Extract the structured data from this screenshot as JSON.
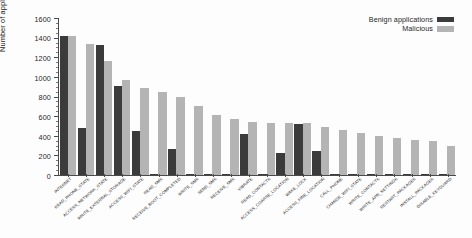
{
  "chart_data": {
    "type": "bar",
    "title": "",
    "subtitle": "",
    "xlabel": "",
    "ylabel": "Number of applications",
    "ylim": [
      0,
      1600
    ],
    "yticks": [
      0,
      200,
      400,
      600,
      800,
      1000,
      1200,
      1400,
      1600
    ],
    "ytick_labels": [
      "0",
      "200",
      "400",
      "600",
      "800",
      "1000",
      "1200",
      "1400",
      "1600"
    ],
    "grid": false,
    "legend_position": "top-right",
    "categories": [
      "INTERNET",
      "READ_PHONE_STATE",
      "ACCESS_NETWORK_STATE",
      "WRITE_EXTERNAL_STORAGE",
      "ACCESS_WIFI_STATE",
      "READ_SMS",
      "RECEIVE_BOOT_COMPLETED",
      "WRITE_SMS",
      "SEND_SMS",
      "RECEIVE_SMS",
      "VIBRATE",
      "READ_CONTACTS",
      "ACCESS_COARSE_LOCATION",
      "WAKE_LOCK",
      "ACCESS_FINE_LOCATION",
      "CALL_PHONE",
      "CHANGE_WIFI_STATE",
      "WRITE_CONTACTS",
      "WRITE_APN_SETTINGS",
      "RESTART_PACKAGES",
      "INSTALL_PACKAGES",
      "DISABLE_KEYGUARD"
    ],
    "series": [
      {
        "name": "Benign applications",
        "color": "#3b3b3b",
        "values": [
          1415,
          480,
          1320,
          910,
          450,
          0,
          265,
          0,
          0,
          0,
          420,
          0,
          225,
          520,
          240,
          0,
          0,
          0,
          0,
          0,
          0,
          0
        ]
      },
      {
        "name": "Malicious",
        "color": "#b4b4b4",
        "values": [
          1415,
          1340,
          1165,
          965,
          890,
          845,
          800,
          700,
          615,
          575,
          545,
          535,
          530,
          525,
          490,
          455,
          430,
          400,
          380,
          360,
          345,
          300
        ]
      }
    ],
    "legend": [
      {
        "label": "Benign applications",
        "color": "#3b3b3b"
      },
      {
        "label": "Malicious",
        "color": "#b4b4b4"
      }
    ],
    "axis_color": "#4a4a4a"
  }
}
